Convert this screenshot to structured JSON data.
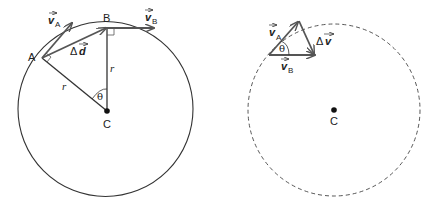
{
  "figure": {
    "left_panel": {
      "description": "Object moving in uniform circular motion from point A to point B around center C",
      "circle": {
        "cx": 105.5,
        "cy": 108.5,
        "r": 87.5,
        "style": "solid"
      },
      "points": {
        "A": {
          "label": "A",
          "x": 42,
          "y": 58
        },
        "B": {
          "label": "B",
          "x": 107,
          "y": 28
        },
        "C": {
          "label": "C",
          "x": 107,
          "y": 111
        }
      },
      "labels": {
        "vA_main": "v",
        "vA_sub": "A",
        "vB_main": "v",
        "vB_sub": "B",
        "delta_d_prefix": "Δ",
        "delta_d_main": "d",
        "radius_CA": "r",
        "radius_CB": "r",
        "angle": "θ"
      }
    },
    "right_panel": {
      "description": "Velocity vector triangle showing change in velocity Δv pointing toward center C",
      "circle": {
        "cx": 334,
        "cy": 110,
        "r": 86,
        "style": "dashed"
      },
      "points": {
        "C": {
          "label": "C",
          "x": 334,
          "y": 110
        }
      },
      "labels": {
        "vA_main": "v",
        "vA_sub": "A",
        "vB_main": "v",
        "vB_sub": "B",
        "delta_v_prefix": "Δ",
        "delta_v_main": "v",
        "angle": "θ"
      }
    }
  }
}
